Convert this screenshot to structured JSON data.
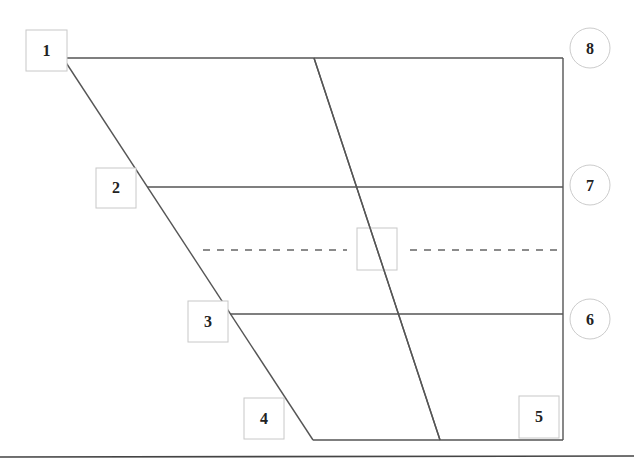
{
  "diagram": {
    "type": "vowel-quadrilateral",
    "square_labels": [
      {
        "id": "1",
        "text": "1"
      },
      {
        "id": "2",
        "text": "2"
      },
      {
        "id": "3",
        "text": "3"
      },
      {
        "id": "4",
        "text": "4"
      },
      {
        "id": "5",
        "text": "5"
      }
    ],
    "circle_labels": [
      {
        "id": "6",
        "text": "6"
      },
      {
        "id": "7",
        "text": "7"
      },
      {
        "id": "8",
        "text": "8"
      }
    ],
    "center_box_text": "",
    "colors": {
      "line": "#555555",
      "box_border": "#c8c8c8",
      "label": "#222222"
    }
  }
}
